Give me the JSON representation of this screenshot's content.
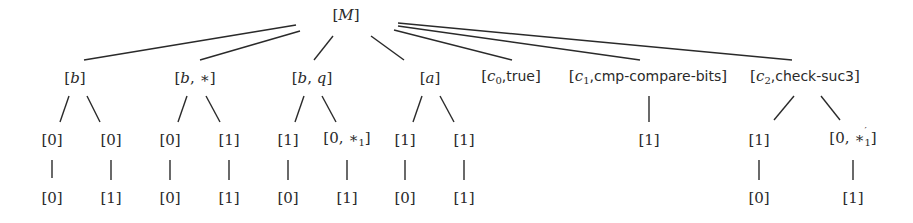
{
  "diagram": {
    "type": "tree",
    "root": {
      "id": "M",
      "label": "[M]",
      "x": 346,
      "y": 15,
      "children": [
        {
          "id": "b",
          "label": "[b]",
          "x": 75,
          "y": 78,
          "children": [
            {
              "label": "[0]",
              "x": 52,
              "y": 140,
              "children": [
                {
                  "label": "[0]",
                  "x": 52,
                  "y": 198
                }
              ]
            },
            {
              "label": "[0]",
              "x": 111,
              "y": 140,
              "children": [
                {
                  "label": "[1]",
                  "x": 111,
                  "y": 198
                }
              ]
            }
          ]
        },
        {
          "id": "b_star",
          "label": "[b, *]",
          "x": 195,
          "y": 78,
          "children": [
            {
              "label": "[0]",
              "x": 170,
              "y": 140,
              "children": [
                {
                  "label": "[0]",
                  "x": 170,
                  "y": 198
                }
              ]
            },
            {
              "label": "[1]",
              "x": 229,
              "y": 140,
              "children": [
                {
                  "label": "[1]",
                  "x": 229,
                  "y": 198
                }
              ]
            }
          ]
        },
        {
          "id": "b_q",
          "label": "[b, q]",
          "x": 312,
          "y": 78,
          "children": [
            {
              "label": "[1]",
              "x": 288,
              "y": 140,
              "children": [
                {
                  "label": "[0]",
                  "x": 288,
                  "y": 198
                }
              ]
            },
            {
              "label": "[0, *1]",
              "x": 347,
              "y": 140,
              "children": [
                {
                  "label": "[1]",
                  "x": 347,
                  "y": 198
                }
              ]
            }
          ]
        },
        {
          "id": "a",
          "label": "[a]",
          "x": 430,
          "y": 78,
          "children": [
            {
              "label": "[1]",
              "x": 405,
              "y": 140,
              "children": [
                {
                  "label": "[0]",
                  "x": 405,
                  "y": 198
                }
              ]
            },
            {
              "label": "[1]",
              "x": 464,
              "y": 140,
              "children": [
                {
                  "label": "[1]",
                  "x": 464,
                  "y": 198
                }
              ]
            }
          ]
        },
        {
          "id": "c0",
          "label": "[c0,true]",
          "x": 511,
          "y": 78,
          "children": []
        },
        {
          "id": "c1",
          "label": "[c1,cmp-compare-bits]",
          "x": 648,
          "y": 78,
          "children": [
            {
              "label": "[1]",
              "x": 649,
              "y": 140,
              "children": []
            }
          ]
        },
        {
          "id": "c2",
          "label": "[c2,check-suc3]",
          "x": 805,
          "y": 78,
          "children": [
            {
              "label": "[1]",
              "x": 759,
              "y": 140,
              "children": [
                {
                  "label": "[0]",
                  "x": 759,
                  "y": 198
                }
              ]
            },
            {
              "label": "[0, *'1]",
              "x": 853,
              "y": 140,
              "children": [
                {
                  "label": "[1]",
                  "x": 853,
                  "y": 198
                }
              ]
            }
          ]
        }
      ]
    }
  },
  "labels": {
    "root": {
      "open": "[",
      "var": "M",
      "close": "]"
    },
    "b": {
      "open": "[",
      "var": "b",
      "close": "]"
    },
    "b_star": {
      "open": "[",
      "var": "b",
      "sep": ", ",
      "rest": "∗",
      "close": "]"
    },
    "b_q": {
      "open": "[",
      "var": "b",
      "sep": ", ",
      "var2": "q",
      "close": "]"
    },
    "a": {
      "open": "[",
      "var": "a",
      "close": "]"
    },
    "c0": {
      "open": "[",
      "var": "c",
      "sub": "0",
      "text": ",true",
      "close": "]"
    },
    "c1": {
      "open": "[",
      "var": "c",
      "sub": "1",
      "text": ",cmp-compare-bits",
      "close": "]"
    },
    "c2": {
      "open": "[",
      "var": "c",
      "sub": "2",
      "text": ",check-suc3",
      "close": "]"
    },
    "b_leaf_l1": "[0]",
    "b_leaf_l2": "[0]",
    "b_leaf_r1": "[0]",
    "b_leaf_r2": "[1]",
    "bs_leaf_l1": "[0]",
    "bs_leaf_l2": "[0]",
    "bs_leaf_r1": "[1]",
    "bs_leaf_r2": "[1]",
    "bq_leaf_l1": "[1]",
    "bq_leaf_l2": "[0]",
    "bq_leaf_r1": {
      "open": "[0, ",
      "star": "∗",
      "sub": "1",
      "close": "]"
    },
    "bq_leaf_r2": "[1]",
    "a_leaf_l1": "[1]",
    "a_leaf_l2": "[0]",
    "a_leaf_r1": "[1]",
    "a_leaf_r2": "[1]",
    "c1_leaf_1": "[1]",
    "c2_leaf_l1": "[1]",
    "c2_leaf_l2": "[0]",
    "c2_leaf_r1": {
      "open": "[0, ",
      "star": "∗",
      "prime": "′",
      "sub": "1",
      "close": "]"
    },
    "c2_leaf_r2": "[1]"
  },
  "colors": {
    "line": "#2a2a2a",
    "text": "#2a2a2a",
    "background": "#ffffff"
  }
}
